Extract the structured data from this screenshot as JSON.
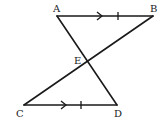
{
  "diagram": {
    "type": "geometry",
    "points": {
      "A": {
        "label": "A",
        "x": 57,
        "y": 16
      },
      "B": {
        "label": "B",
        "x": 153,
        "y": 16
      },
      "C": {
        "label": "C",
        "x": 24,
        "y": 105
      },
      "D": {
        "label": "D",
        "x": 117,
        "y": 105
      },
      "E": {
        "label": "E",
        "x": 87,
        "y": 61
      }
    },
    "segments": [
      "AB",
      "CD",
      "AD",
      "BC"
    ],
    "markings": {
      "AB": {
        "parallel_arrow": true,
        "tick_marks": 1
      },
      "CD": {
        "parallel_arrow": true,
        "tick_marks": 1
      }
    },
    "colors": {
      "stroke": "#1a1a1a",
      "background": "#ffffff"
    }
  }
}
